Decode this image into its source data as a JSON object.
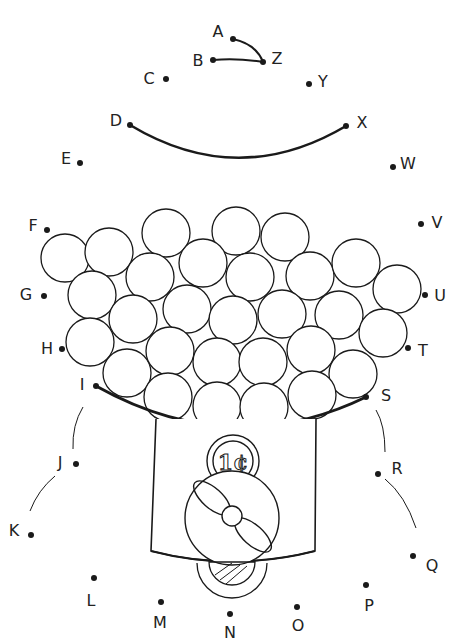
{
  "worksheet": {
    "title": "Gumball Machine Connect-the-Dots",
    "ink_color": "#1a1a1a",
    "background": "#ffffff",
    "coin_label": "1¢",
    "dots": [
      {
        "label": "A",
        "x": 233,
        "y": 39,
        "lx": 218,
        "ly": 37
      },
      {
        "label": "B",
        "x": 213,
        "y": 60,
        "lx": 198,
        "ly": 66
      },
      {
        "label": "C",
        "x": 166,
        "y": 79,
        "lx": 149,
        "ly": 84
      },
      {
        "label": "D",
        "x": 130,
        "y": 125,
        "lx": 116,
        "ly": 126
      },
      {
        "label": "E",
        "x": 80,
        "y": 163,
        "lx": 66,
        "ly": 164
      },
      {
        "label": "F",
        "x": 47,
        "y": 230,
        "lx": 33,
        "ly": 231
      },
      {
        "label": "G",
        "x": 44,
        "y": 296,
        "lx": 26,
        "ly": 300
      },
      {
        "label": "H",
        "x": 62,
        "y": 349,
        "lx": 47,
        "ly": 354
      },
      {
        "label": "I",
        "x": 96,
        "y": 386,
        "lx": 82,
        "ly": 390
      },
      {
        "label": "J",
        "x": 76,
        "y": 464,
        "lx": 60,
        "ly": 468
      },
      {
        "label": "K",
        "x": 31,
        "y": 535,
        "lx": 14,
        "ly": 536
      },
      {
        "label": "L",
        "x": 94,
        "y": 578,
        "lx": 91,
        "ly": 606
      },
      {
        "label": "M",
        "x": 161,
        "y": 602,
        "lx": 160,
        "ly": 628
      },
      {
        "label": "N",
        "x": 230,
        "y": 614,
        "lx": 230,
        "ly": 638
      },
      {
        "label": "O",
        "x": 297,
        "y": 607,
        "lx": 298,
        "ly": 631
      },
      {
        "label": "P",
        "x": 366,
        "y": 585,
        "lx": 369,
        "ly": 611
      },
      {
        "label": "Q",
        "x": 413,
        "y": 556,
        "lx": 432,
        "ly": 571
      },
      {
        "label": "R",
        "x": 378,
        "y": 474,
        "lx": 397,
        "ly": 474
      },
      {
        "label": "S",
        "x": 366,
        "y": 397,
        "lx": 386,
        "ly": 401
      },
      {
        "label": "T",
        "x": 408,
        "y": 348,
        "lx": 423,
        "ly": 356
      },
      {
        "label": "U",
        "x": 425,
        "y": 295,
        "lx": 440,
        "ly": 301
      },
      {
        "label": "V",
        "x": 421,
        "y": 224,
        "lx": 437,
        "ly": 228
      },
      {
        "label": "W",
        "x": 393,
        "y": 167,
        "lx": 408,
        "ly": 169
      },
      {
        "label": "X",
        "x": 346,
        "y": 126,
        "lx": 362,
        "ly": 128
      },
      {
        "label": "Y",
        "x": 309,
        "y": 84,
        "lx": 323,
        "ly": 87
      },
      {
        "label": "Z",
        "x": 263,
        "y": 62,
        "lx": 277,
        "ly": 64
      }
    ],
    "gumballs": [
      [
        65,
        258
      ],
      [
        109,
        252
      ],
      [
        166,
        233
      ],
      [
        236,
        231
      ],
      [
        285,
        237
      ],
      [
        92,
        295
      ],
      [
        150,
        277
      ],
      [
        203,
        263
      ],
      [
        250,
        277
      ],
      [
        310,
        276
      ],
      [
        356,
        263
      ],
      [
        397,
        289
      ],
      [
        90,
        342
      ],
      [
        133,
        319
      ],
      [
        187,
        309
      ],
      [
        233,
        320
      ],
      [
        282,
        314
      ],
      [
        339,
        315
      ],
      [
        383,
        333
      ],
      [
        127,
        373
      ],
      [
        170,
        351
      ],
      [
        217,
        362
      ],
      [
        263,
        362
      ],
      [
        311,
        350
      ],
      [
        353,
        374
      ],
      [
        168,
        397
      ],
      [
        217,
        406
      ],
      [
        264,
        407
      ],
      [
        312,
        395
      ]
    ]
  }
}
